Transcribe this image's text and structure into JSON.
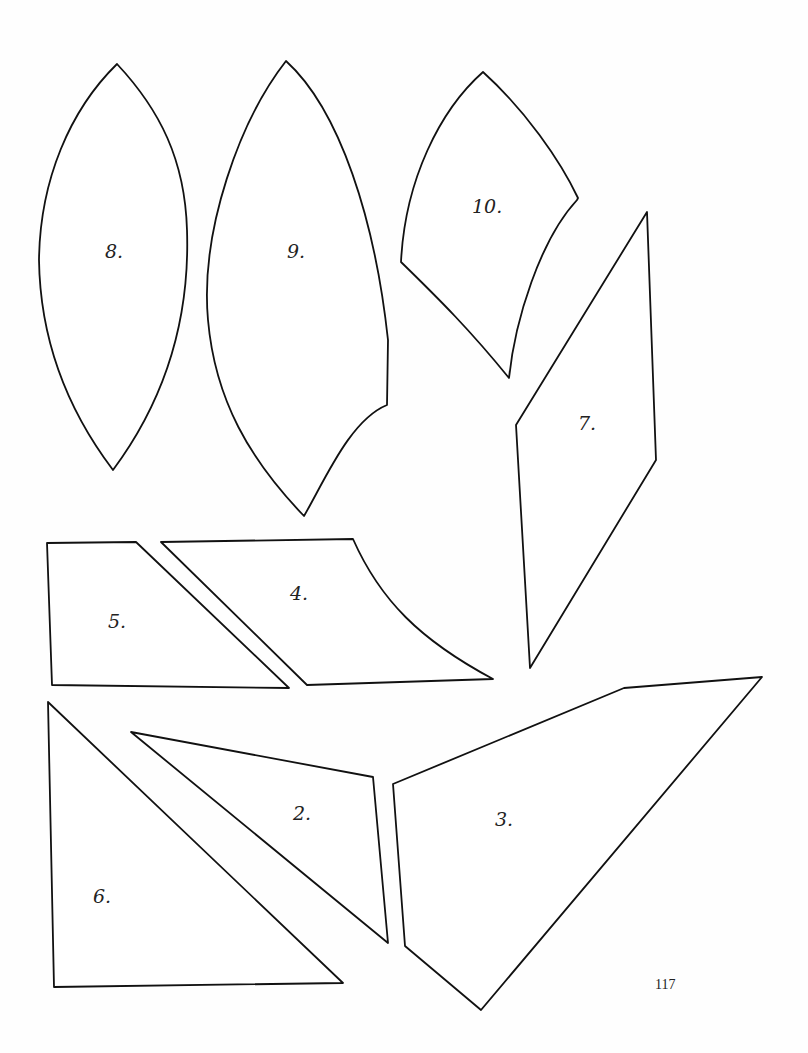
{
  "page": {
    "number": "117"
  },
  "pieces": [
    {
      "id": "piece-8",
      "label": "8."
    },
    {
      "id": "piece-9",
      "label": "9."
    },
    {
      "id": "piece-10",
      "label": "10."
    },
    {
      "id": "piece-7",
      "label": "7."
    },
    {
      "id": "piece-5",
      "label": "5."
    },
    {
      "id": "piece-4",
      "label": "4."
    },
    {
      "id": "piece-6",
      "label": "6."
    },
    {
      "id": "piece-2",
      "label": "2."
    },
    {
      "id": "piece-3",
      "label": "3."
    }
  ]
}
